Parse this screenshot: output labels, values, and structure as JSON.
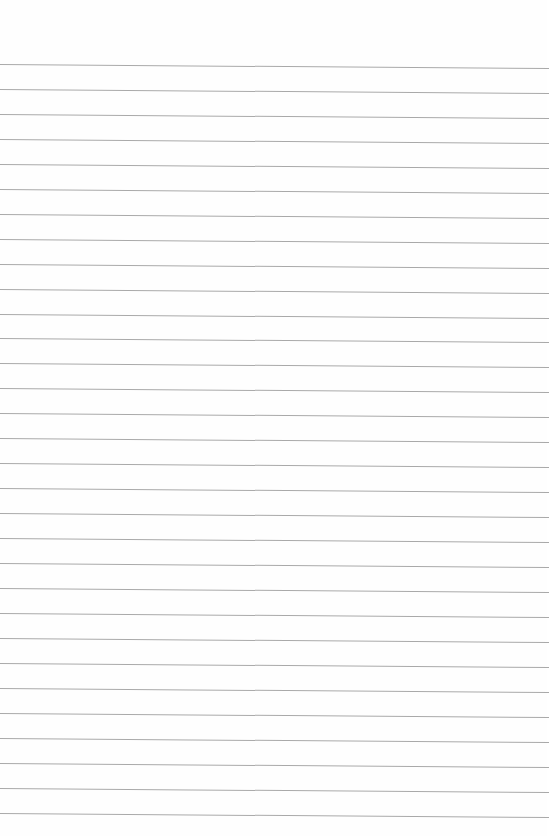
{
  "page": {
    "type": "lined-paper",
    "line_count": 31,
    "first_line_y": 64,
    "line_spacing": 24.95,
    "line_color": "#a9a9a9",
    "background_color": "#fefefe"
  }
}
